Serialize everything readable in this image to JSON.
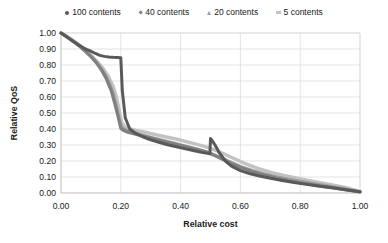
{
  "chart_data": {
    "type": "line",
    "title": "",
    "xlabel": "Relative cost",
    "ylabel": "Relative QoS",
    "xlim": [
      0.0,
      1.0
    ],
    "ylim": [
      0.0,
      1.0
    ],
    "xticks": [
      "0.00",
      "0.20",
      "0.40",
      "0.60",
      "0.80",
      "1.00"
    ],
    "xtick_values": [
      0.0,
      0.2,
      0.4,
      0.6,
      0.8,
      1.0
    ],
    "yticks": [
      "0.00",
      "0.10",
      "0.20",
      "0.30",
      "0.40",
      "0.50",
      "0.60",
      "0.70",
      "0.80",
      "0.90",
      "1.00"
    ],
    "ytick_values": [
      0.0,
      0.1,
      0.2,
      0.3,
      0.4,
      0.5,
      0.6,
      0.7,
      0.8,
      0.9,
      1.0
    ],
    "grid": "horizontal-and-vertical",
    "legend_position": "top-center",
    "series": [
      {
        "name": "100 contents",
        "marker": "circle",
        "color": "#595959",
        "x": [
          0.0,
          0.012,
          0.025,
          0.04,
          0.055,
          0.07,
          0.085,
          0.1,
          0.115,
          0.13,
          0.145,
          0.16,
          0.175,
          0.19,
          0.198,
          0.2,
          0.205,
          0.215,
          0.23,
          0.25,
          0.275,
          0.3,
          0.33,
          0.36,
          0.39,
          0.42,
          0.45,
          0.47,
          0.49,
          0.498,
          0.5,
          0.505,
          0.515,
          0.53,
          0.55,
          0.57,
          0.6,
          0.63,
          0.66,
          0.7,
          0.74,
          0.78,
          0.82,
          0.86,
          0.9,
          0.94,
          0.97,
          1.0
        ],
        "y": [
          1.0,
          0.985,
          0.968,
          0.948,
          0.93,
          0.912,
          0.898,
          0.886,
          0.872,
          0.86,
          0.854,
          0.85,
          0.848,
          0.847,
          0.846,
          0.846,
          0.64,
          0.47,
          0.4,
          0.372,
          0.35,
          0.333,
          0.316,
          0.3,
          0.287,
          0.274,
          0.262,
          0.254,
          0.248,
          0.246,
          0.34,
          0.33,
          0.3,
          0.25,
          0.2,
          0.168,
          0.14,
          0.122,
          0.108,
          0.092,
          0.078,
          0.065,
          0.054,
          0.044,
          0.034,
          0.024,
          0.016,
          0.008
        ]
      },
      {
        "name": "40 contents",
        "marker": "diamond",
        "color": "#808080",
        "x": [
          0.0,
          0.015,
          0.03,
          0.048,
          0.065,
          0.082,
          0.1,
          0.118,
          0.135,
          0.152,
          0.168,
          0.182,
          0.192,
          0.2,
          0.208,
          0.22,
          0.24,
          0.265,
          0.295,
          0.325,
          0.36,
          0.395,
          0.43,
          0.46,
          0.49,
          0.51,
          0.54,
          0.57,
          0.6,
          0.64,
          0.68,
          0.72,
          0.76,
          0.8,
          0.84,
          0.88,
          0.92,
          0.96,
          1.0
        ],
        "y": [
          1.0,
          0.982,
          0.962,
          0.938,
          0.912,
          0.884,
          0.852,
          0.815,
          0.77,
          0.712,
          0.64,
          0.545,
          0.47,
          0.405,
          0.392,
          0.382,
          0.372,
          0.36,
          0.346,
          0.332,
          0.316,
          0.3,
          0.284,
          0.27,
          0.254,
          0.238,
          0.21,
          0.184,
          0.16,
          0.134,
          0.112,
          0.094,
          0.078,
          0.064,
          0.052,
          0.04,
          0.03,
          0.018,
          0.006
        ]
      },
      {
        "name": "20 contents",
        "marker": "triangle",
        "color": "#9e9e9e",
        "x": [
          0.0,
          0.018,
          0.036,
          0.055,
          0.074,
          0.092,
          0.11,
          0.128,
          0.146,
          0.162,
          0.176,
          0.188,
          0.196,
          0.202,
          0.212,
          0.228,
          0.25,
          0.28,
          0.312,
          0.345,
          0.38,
          0.415,
          0.448,
          0.478,
          0.505,
          0.535,
          0.568,
          0.6,
          0.64,
          0.682,
          0.725,
          0.768,
          0.81,
          0.855,
          0.9,
          0.945,
          1.0
        ],
        "y": [
          1.0,
          0.98,
          0.958,
          0.932,
          0.904,
          0.872,
          0.836,
          0.795,
          0.746,
          0.686,
          0.612,
          0.52,
          0.452,
          0.412,
          0.398,
          0.386,
          0.374,
          0.358,
          0.342,
          0.326,
          0.31,
          0.294,
          0.278,
          0.262,
          0.244,
          0.22,
          0.192,
          0.166,
          0.14,
          0.118,
          0.1,
          0.084,
          0.07,
          0.056,
          0.042,
          0.028,
          0.008
        ]
      },
      {
        "name": "5 contents",
        "marker": "square",
        "color": "#c2c2c2",
        "x": [
          0.0,
          0.02,
          0.04,
          0.06,
          0.08,
          0.1,
          0.12,
          0.14,
          0.158,
          0.174,
          0.186,
          0.195,
          0.203,
          0.215,
          0.232,
          0.255,
          0.285,
          0.318,
          0.352,
          0.388,
          0.422,
          0.455,
          0.485,
          0.515,
          0.548,
          0.582,
          0.618,
          0.658,
          0.7,
          0.745,
          0.79,
          0.835,
          0.88,
          0.925,
          0.965,
          1.0
        ],
        "y": [
          1.0,
          0.978,
          0.954,
          0.926,
          0.896,
          0.862,
          0.824,
          0.78,
          0.73,
          0.668,
          0.596,
          0.512,
          0.44,
          0.412,
          0.4,
          0.39,
          0.378,
          0.364,
          0.35,
          0.336,
          0.32,
          0.304,
          0.288,
          0.268,
          0.242,
          0.212,
          0.182,
          0.154,
          0.13,
          0.11,
          0.092,
          0.076,
          0.06,
          0.044,
          0.028,
          0.01
        ]
      }
    ]
  },
  "legend": {
    "items": [
      {
        "label": "100 contents",
        "marker": "circle-marker-icon",
        "color": "#595959"
      },
      {
        "label": "40 contents",
        "marker": "diamond-marker-icon",
        "color": "#808080"
      },
      {
        "label": "20 contents",
        "marker": "triangle-marker-icon",
        "color": "#9e9e9e"
      },
      {
        "label": "5 contents",
        "marker": "square-marker-icon",
        "color": "#c2c2c2"
      }
    ]
  },
  "axes": {
    "y_title": "Relative QoS",
    "x_title": "Relative cost"
  }
}
